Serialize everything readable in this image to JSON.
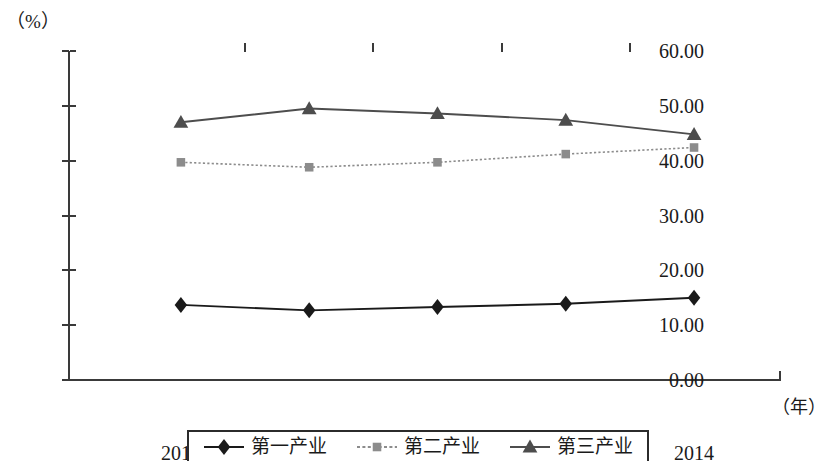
{
  "chart_data": {
    "type": "line",
    "title": "",
    "xlabel": "（年）",
    "ylabel": "（%）",
    "x": [
      "2010",
      "2011",
      "2012",
      "2013",
      "2014"
    ],
    "categories": [
      "2010",
      "2011",
      "2012",
      "2013",
      "2014"
    ],
    "ylim": [
      0.0,
      60.0
    ],
    "yticks": [
      "0.00",
      "10.00",
      "20.00",
      "30.00",
      "40.00",
      "50.00",
      "60.00"
    ],
    "ytick_values": [
      0,
      10,
      20,
      30,
      40,
      50,
      60
    ],
    "grid": false,
    "legend_position": "bottom",
    "series": [
      {
        "name": "第一产业",
        "marker": "diamond",
        "color": "#1a1a1a",
        "line_style": "solid",
        "values": [
          13.7,
          12.7,
          13.3,
          13.9,
          15.0
        ]
      },
      {
        "name": "第二产业",
        "marker": "square",
        "color": "#8c8c8c",
        "line_style": "dotted",
        "values": [
          39.7,
          38.8,
          39.7,
          41.2,
          42.4
        ]
      },
      {
        "name": "第三产业",
        "marker": "triangle",
        "color": "#4d4d4d",
        "line_style": "solid",
        "values": [
          47.0,
          49.5,
          48.6,
          47.4,
          44.8
        ]
      }
    ]
  },
  "axis": {
    "y_unit": "（%）",
    "x_unit": "（年）"
  },
  "legend": {
    "items": [
      {
        "label": "第一产业",
        "marker": "diamond-marker",
        "color": "#1a1a1a"
      },
      {
        "label": "第二产业",
        "marker": "square-marker",
        "color": "#8c8c8c"
      },
      {
        "label": "第三产业",
        "marker": "triangle-marker",
        "color": "#4d4d4d"
      }
    ]
  }
}
